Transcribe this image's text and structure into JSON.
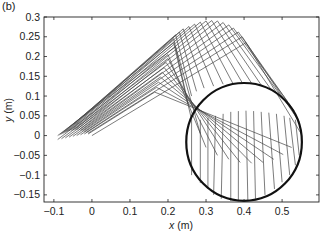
{
  "panel_label": "(b)",
  "chart_data": {
    "type": "line",
    "title": "",
    "xlabel": "x (m)",
    "ylabel": "y (m)",
    "xlim": [
      -0.126,
      0.597
    ],
    "ylim": [
      -0.168,
      0.3
    ],
    "xticks": [
      -0.1,
      0,
      0.1,
      0.2,
      0.3,
      0.4,
      0.5
    ],
    "xtick_labels": [
      "−0.1",
      "0",
      "0.1",
      "0.2",
      "0.3",
      "0.4",
      "0.5"
    ],
    "yticks": [
      0.3,
      0.25,
      0.2,
      0.15,
      0.1,
      0.05,
      0,
      -0.05,
      -0.1,
      -0.15
    ],
    "ytick_labels": [
      "0.3",
      "0.25",
      "0.2",
      "0.15",
      "0.1",
      "0.05",
      "0",
      "−0.05",
      "−0.1",
      "−0.15"
    ],
    "grid": false,
    "legend": null,
    "circle": {
      "cx": 0.4,
      "cy": -0.016,
      "r": 0.152,
      "ry": 0.149,
      "color": "#111111",
      "width": 2.2
    },
    "linkage_color": "#444444",
    "linkage_configurations": [
      [
        [
          -0.09,
          0.0
        ],
        [
          0.22,
          0.225
        ],
        [
          0.285,
          0.005
        ]
      ],
      [
        [
          -0.085,
          0.002
        ],
        [
          0.215,
          0.235
        ],
        [
          0.262,
          0.04
        ]
      ],
      [
        [
          -0.08,
          0.004
        ],
        [
          0.215,
          0.245
        ],
        [
          0.253,
          0.08
        ]
      ],
      [
        [
          -0.075,
          0.006
        ],
        [
          0.22,
          0.255
        ],
        [
          0.262,
          0.1
        ]
      ],
      [
        [
          -0.07,
          0.008
        ],
        [
          0.23,
          0.262
        ],
        [
          0.275,
          0.112
        ]
      ],
      [
        [
          -0.065,
          0.01
        ],
        [
          0.24,
          0.27
        ],
        [
          0.295,
          0.12
        ]
      ],
      [
        [
          -0.06,
          0.012
        ],
        [
          0.255,
          0.276
        ],
        [
          0.32,
          0.125
        ]
      ],
      [
        [
          -0.055,
          0.013
        ],
        [
          0.27,
          0.282
        ],
        [
          0.345,
          0.13
        ]
      ],
      [
        [
          -0.05,
          0.014
        ],
        [
          0.285,
          0.287
        ],
        [
          0.37,
          0.133
        ]
      ],
      [
        [
          -0.045,
          0.015
        ],
        [
          0.3,
          0.29
        ],
        [
          0.395,
          0.134
        ]
      ],
      [
        [
          -0.04,
          0.015
        ],
        [
          0.315,
          0.291
        ],
        [
          0.42,
          0.132
        ]
      ],
      [
        [
          -0.035,
          0.014
        ],
        [
          0.33,
          0.29
        ],
        [
          0.445,
          0.128
        ]
      ],
      [
        [
          -0.03,
          0.013
        ],
        [
          0.345,
          0.286
        ],
        [
          0.47,
          0.118
        ]
      ],
      [
        [
          -0.025,
          0.012
        ],
        [
          0.36,
          0.28
        ],
        [
          0.495,
          0.103
        ]
      ],
      [
        [
          -0.02,
          0.01
        ],
        [
          0.372,
          0.272
        ],
        [
          0.515,
          0.085
        ]
      ],
      [
        [
          -0.015,
          0.008
        ],
        [
          0.385,
          0.262
        ],
        [
          0.532,
          0.062
        ]
      ],
      [
        [
          -0.01,
          0.006
        ],
        [
          0.395,
          0.25
        ],
        [
          0.545,
          0.035
        ]
      ],
      [
        [
          0.0,
          0.0
        ],
        [
          0.405,
          0.235
        ],
        [
          0.55,
          0.005
        ]
      ],
      [
        [
          -0.09,
          -0.01
        ],
        [
          0.2,
          0.205
        ],
        [
          0.3,
          -0.03
        ]
      ],
      [
        [
          -0.08,
          -0.008
        ],
        [
          0.2,
          0.195
        ],
        [
          0.33,
          -0.05
        ]
      ],
      [
        [
          -0.07,
          -0.006
        ],
        [
          0.195,
          0.185
        ],
        [
          0.36,
          -0.06
        ]
      ],
      [
        [
          -0.06,
          -0.004
        ],
        [
          0.19,
          0.172
        ],
        [
          0.39,
          -0.068
        ]
      ],
      [
        [
          -0.05,
          -0.002
        ],
        [
          0.185,
          0.16
        ],
        [
          0.42,
          -0.07
        ]
      ],
      [
        [
          -0.04,
          0.0
        ],
        [
          0.18,
          0.148
        ],
        [
          0.45,
          -0.068
        ]
      ],
      [
        [
          -0.03,
          0.002
        ],
        [
          0.175,
          0.135
        ],
        [
          0.478,
          -0.06
        ]
      ],
      [
        [
          -0.02,
          0.004
        ],
        [
          0.17,
          0.122
        ],
        [
          0.503,
          -0.048
        ]
      ],
      [
        [
          -0.01,
          0.004
        ],
        [
          0.165,
          0.11
        ],
        [
          0.525,
          -0.03
        ]
      ]
    ],
    "end_effector_segments": [
      [
        [
          0.262,
          0.04
        ],
        [
          0.262,
          -0.1
        ]
      ],
      [
        [
          0.285,
          0.04
        ],
        [
          0.285,
          -0.12
        ]
      ],
      [
        [
          0.305,
          0.045
        ],
        [
          0.305,
          -0.135
        ]
      ],
      [
        [
          0.325,
          0.05
        ],
        [
          0.32,
          -0.15
        ]
      ],
      [
        [
          0.345,
          0.055
        ],
        [
          0.34,
          -0.16
        ]
      ],
      [
        [
          0.365,
          0.06
        ],
        [
          0.365,
          -0.165
        ]
      ],
      [
        [
          0.385,
          0.062
        ],
        [
          0.385,
          -0.166
        ]
      ],
      [
        [
          0.405,
          0.063
        ],
        [
          0.41,
          -0.166
        ]
      ],
      [
        [
          0.425,
          0.062
        ],
        [
          0.43,
          -0.16
        ]
      ],
      [
        [
          0.445,
          0.06
        ],
        [
          0.455,
          -0.15
        ]
      ],
      [
        [
          0.465,
          0.058
        ],
        [
          0.48,
          -0.135
        ]
      ],
      [
        [
          0.485,
          0.055
        ],
        [
          0.5,
          -0.118
        ]
      ],
      [
        [
          0.505,
          0.05
        ],
        [
          0.52,
          -0.1
        ]
      ],
      [
        [
          0.52,
          0.045
        ],
        [
          0.535,
          -0.075
        ]
      ],
      [
        [
          0.535,
          0.04
        ],
        [
          0.545,
          -0.05
        ]
      ]
    ]
  }
}
